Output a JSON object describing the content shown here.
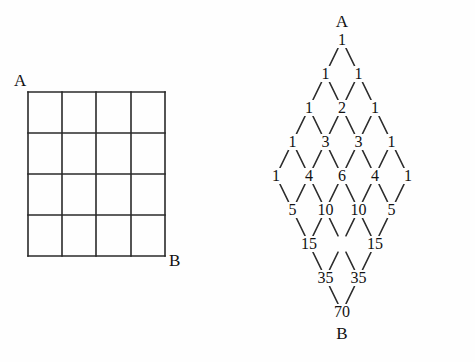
{
  "figure_left": {
    "name": "grid-figure",
    "label_a": "A",
    "label_b": "B",
    "rows": 4,
    "cols": 4,
    "bounds": {
      "x": 28,
      "y": 92,
      "w": 137,
      "h": 164
    }
  },
  "figure_right": {
    "name": "pascal-diamond-figure",
    "label_a": "A",
    "label_b": "B",
    "origin": {
      "x": 142,
      "y": 40
    },
    "dx": 33,
    "dy": 34,
    "rows": [
      {
        "row": 0,
        "values": [
          "1"
        ]
      },
      {
        "row": 1,
        "values": [
          "1",
          "1"
        ]
      },
      {
        "row": 2,
        "values": [
          "1",
          "2",
          "1"
        ]
      },
      {
        "row": 3,
        "values": [
          "1",
          "3",
          "3",
          "1"
        ]
      },
      {
        "row": 4,
        "values": [
          "1",
          "4",
          "6",
          "4",
          "1"
        ]
      },
      {
        "row": 5,
        "values": [
          "5",
          "10",
          "10",
          "5"
        ]
      },
      {
        "row": 6,
        "values": [
          "15",
          "",
          "15"
        ]
      },
      {
        "row": 7,
        "values": [
          "35",
          "35"
        ]
      },
      {
        "row": 8,
        "values": [
          "70"
        ]
      }
    ],
    "row_offsets": [
      0,
      0,
      0,
      0,
      0,
      1,
      2,
      3,
      4
    ]
  },
  "chart_data": {
    "type": "diagram",
    "title": "",
    "left_figure": {
      "type": "grid",
      "rows": 4,
      "cols": 4,
      "corner_start": "A",
      "corner_end": "B"
    },
    "right_figure": {
      "type": "pascal-diamond",
      "start_label": "A",
      "end_label": "B",
      "levels": [
        [
          1
        ],
        [
          1,
          1
        ],
        [
          1,
          2,
          1
        ],
        [
          1,
          3,
          3,
          1
        ],
        [
          1,
          4,
          6,
          4,
          1
        ],
        [
          5,
          10,
          10,
          5
        ],
        [
          15,
          null,
          15
        ],
        [
          35,
          35
        ],
        [
          70
        ]
      ],
      "total_paths": 70
    }
  }
}
